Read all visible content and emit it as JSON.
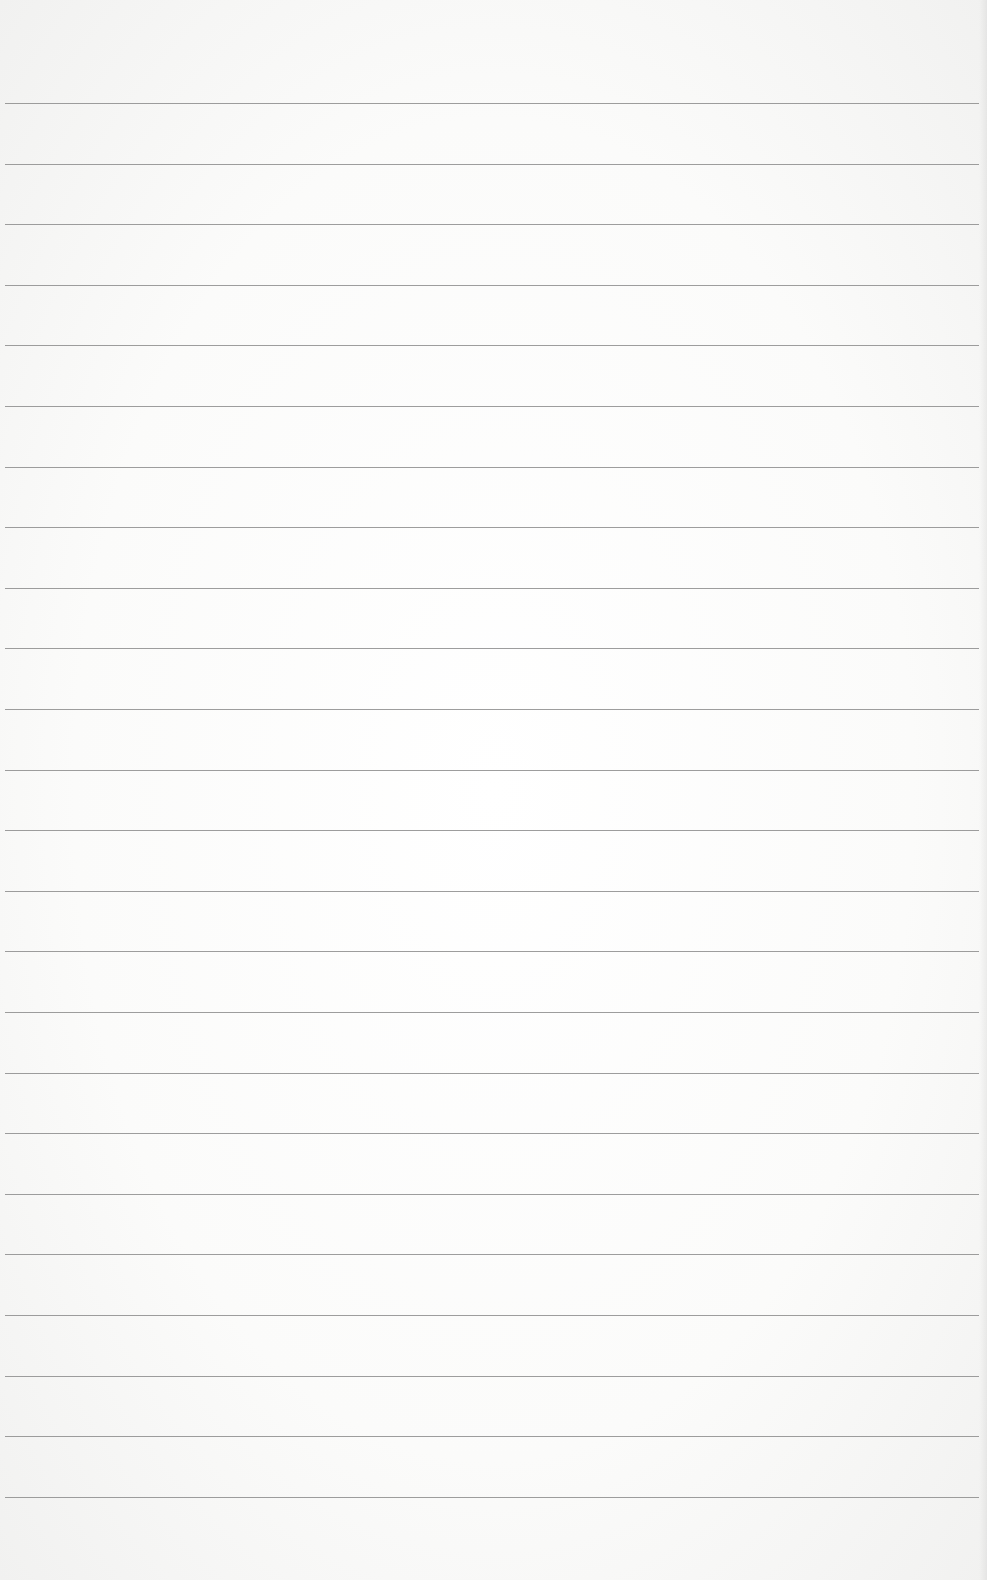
{
  "page": {
    "type": "ruled-paper",
    "background_color": "#fbfbfa",
    "line_color": "#8c8c8c",
    "line_count": 24,
    "first_line_y": 103,
    "line_spacing": 60.6,
    "line_left": 5,
    "line_right": 979,
    "text_content": []
  }
}
